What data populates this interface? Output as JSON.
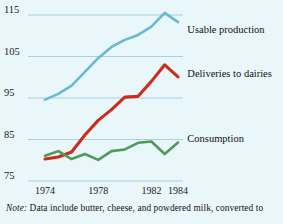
{
  "figure": {
    "background_color": "#e9f6fa",
    "note_prefix": "Note:",
    "note_text": "Data include butter, cheese, and powdered milk, converted to"
  },
  "chart_data": {
    "type": "line",
    "title": "",
    "xlabel": "",
    "ylabel": "",
    "grid": true,
    "legend_position": "right-inline",
    "xlim": [
      1973.3,
      1984.2
    ],
    "ylim": [
      73.5,
      117.5
    ],
    "yticks": [
      75,
      85,
      95,
      105,
      115
    ],
    "xticks": [
      1974,
      1978,
      1982,
      1984
    ],
    "xtick_labels": [
      "1974",
      "1978",
      "1982",
      "1984"
    ],
    "ytick_labels": [
      "75",
      "85",
      "95",
      "105",
      "115"
    ],
    "x": [
      1974,
      1975,
      1976,
      1977,
      1978,
      1979,
      1980,
      1981,
      1982,
      1983,
      1984
    ],
    "series": [
      {
        "name": "Usable production",
        "color": "#6bb9cf",
        "label_x": 1984.4,
        "label_y": 110.6,
        "values": [
          94.6,
          96.0,
          98.0,
          101.3,
          104.6,
          107.3,
          109.0,
          110.2,
          112.2,
          115.5,
          113.3
        ]
      },
      {
        "name": "Deliveries to dairies",
        "color": "#cc2c1c",
        "label_x": 1984.4,
        "label_y": 100.0,
        "values": [
          80.3,
          80.8,
          82.0,
          86.1,
          89.6,
          92.2,
          95.2,
          95.4,
          99.0,
          103.0,
          100.1
        ]
      },
      {
        "name": "Consumption",
        "color": "#4f9a56",
        "label_x": 1984.4,
        "label_y": 84.4,
        "values": [
          81.1,
          82.2,
          80.3,
          81.5,
          80.1,
          82.2,
          82.6,
          84.2,
          84.5,
          81.5,
          84.3
        ]
      }
    ]
  }
}
